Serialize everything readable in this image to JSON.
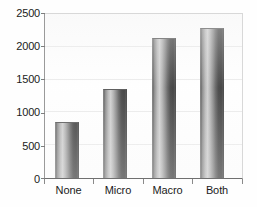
{
  "chart_data": {
    "type": "bar",
    "title": "",
    "subtitle": "",
    "xlabel": "",
    "ylabel": "",
    "categories": [
      "None",
      "Micro",
      "Macro",
      "Both"
    ],
    "values": [
      850,
      1365,
      2140,
      2290
    ],
    "series": [
      {
        "name": "",
        "values": [
          850,
          1365,
          2140,
          2290
        ]
      }
    ],
    "ylim": [
      0,
      2500
    ],
    "ytick_labels": [
      "0",
      "500",
      "1000",
      "1500",
      "2000",
      "2500"
    ],
    "ytick_values": [
      0,
      500,
      1000,
      1500,
      2000,
      2500
    ],
    "grid": true,
    "grid_axis": "y",
    "legend": false,
    "legend_position": "none",
    "annotations": [],
    "bar_color": "#1a1a1a",
    "bar_style": "cylinder-gradient",
    "background_color": "#ffffff",
    "axis_color": "#6f6f6f",
    "text_color": "#1b1b1b"
  }
}
